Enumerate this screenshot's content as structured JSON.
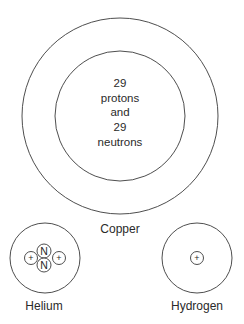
{
  "diagram": {
    "atoms": [
      {
        "name": "Copper",
        "label": "Copper",
        "nucleus_text": [
          "29",
          "protons",
          "and",
          "29",
          "neutrons"
        ]
      },
      {
        "name": "Helium",
        "label": "Helium",
        "particles": [
          {
            "type": "proton",
            "glyph": "+"
          },
          {
            "type": "neutron",
            "glyph": "N"
          },
          {
            "type": "neutron",
            "glyph": "N"
          },
          {
            "type": "proton",
            "glyph": "+"
          }
        ]
      },
      {
        "name": "Hydrogen",
        "label": "Hydrogen",
        "particles": [
          {
            "type": "proton",
            "glyph": "+"
          }
        ]
      }
    ]
  }
}
